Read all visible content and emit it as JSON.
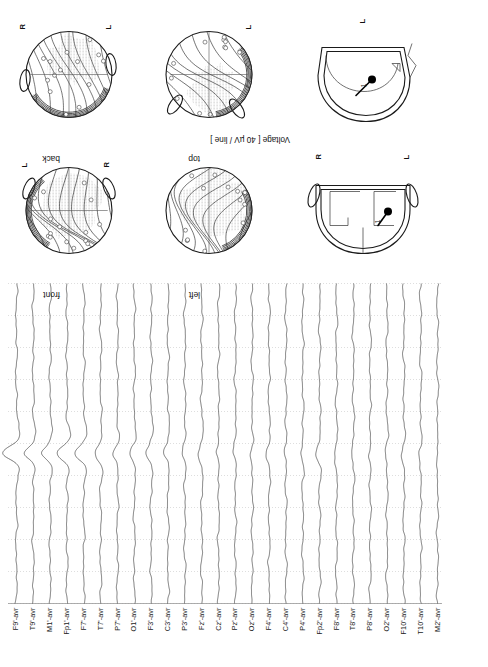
{
  "figure": {
    "voltage_caption": "Voltage [ 40 µV / line ]"
  },
  "eeg": {
    "channel_suffix": "-avr",
    "n_channels": 26,
    "channels": [
      "F9'-avr",
      "T9'-avr",
      "M1'-avr",
      "Fp1'-avr",
      "F7'-avr",
      "T7'-avr",
      "P7'-avr",
      "O1'-avr",
      "F3'-avr",
      "C3'-avr",
      "P3'-avr",
      "Fz'-avr",
      "Cz'-avr",
      "Pz'-avr",
      "Oz'-avr",
      "F4'-avr",
      "C4'-avr",
      "P4'-avr",
      "Fp2'-avr",
      "F8'-avr",
      "T8'-avr",
      "P8'-avr",
      "O2'-avr",
      "F10'-avr",
      "T10'-avr",
      "M2'-avr"
    ],
    "gridlines": 10,
    "trace_color": "#333333",
    "grid_color": "#c8c8c8"
  },
  "maps": {
    "views": [
      {
        "id": "front",
        "label": "front",
        "left_label": "L",
        "right_label": "R"
      },
      {
        "id": "back",
        "label": "back",
        "left_label": "L",
        "right_label": "R"
      },
      {
        "id": "left",
        "label": "left",
        "left_label": "",
        "right_label": ""
      },
      {
        "id": "top",
        "label": "top",
        "left_label": "L",
        "right_label": ""
      }
    ]
  },
  "dipole_views": [
    {
      "id": "coronal",
      "label_left": "L",
      "label_right": "R",
      "dipole_number": "1"
    },
    {
      "id": "sagittal",
      "label_left": "L",
      "label_right": "",
      "dipole_number": "1"
    }
  ],
  "chart_data": {
    "type": "line",
    "xlabel": "",
    "ylabel": "",
    "units": "µV",
    "scale_per_line": 40,
    "categories": [
      "F9'-avr",
      "T9'-avr",
      "M1'-avr",
      "Fp1'-avr",
      "F7'-avr",
      "T7'-avr",
      "P7'-avr",
      "O1'-avr",
      "F3'-avr",
      "C3'-avr",
      "P3'-avr",
      "Fz'-avr",
      "Cz'-avr",
      "Pz'-avr",
      "Oz'-avr",
      "F4'-avr",
      "C4'-avr",
      "P4'-avr",
      "Fp2'-avr",
      "F8'-avr",
      "T8'-avr",
      "P8'-avr",
      "O2'-avr",
      "F10'-avr",
      "T10'-avr",
      "M2'-avr"
    ],
    "gridlines": 10,
    "peak_position_fraction": 0.47,
    "series": [
      {
        "name": "F9'-avr",
        "peak_amplitude": 0.95
      },
      {
        "name": "T9'-avr",
        "peak_amplitude": 0.62
      },
      {
        "name": "M1'-avr",
        "peak_amplitude": 0.58
      },
      {
        "name": "Fp1'-avr",
        "peak_amplitude": 0.7
      },
      {
        "name": "F7'-avr",
        "peak_amplitude": 0.55
      },
      {
        "name": "T7'-avr",
        "peak_amplitude": 0.4
      },
      {
        "name": "P7'-avr",
        "peak_amplitude": 0.3
      },
      {
        "name": "O1'-avr",
        "peak_amplitude": 0.22
      },
      {
        "name": "F3'-avr",
        "peak_amplitude": 0.34
      },
      {
        "name": "C3'-avr",
        "peak_amplitude": 0.26
      },
      {
        "name": "P3'-avr",
        "peak_amplitude": 0.2
      },
      {
        "name": "Fz'-avr",
        "peak_amplitude": 0.24
      },
      {
        "name": "Cz'-avr",
        "peak_amplitude": 0.18
      },
      {
        "name": "Pz'-avr",
        "peak_amplitude": 0.16
      },
      {
        "name": "Oz'-avr",
        "peak_amplitude": 0.14
      },
      {
        "name": "F4'-avr",
        "peak_amplitude": 0.16
      },
      {
        "name": "C4'-avr",
        "peak_amplitude": 0.12
      },
      {
        "name": "P4'-avr",
        "peak_amplitude": 0.12
      },
      {
        "name": "Fp2'-avr",
        "peak_amplitude": 0.3
      },
      {
        "name": "F8'-avr",
        "peak_amplitude": 0.14
      },
      {
        "name": "T8'-avr",
        "peak_amplitude": 0.1
      },
      {
        "name": "P8'-avr",
        "peak_amplitude": 0.1
      },
      {
        "name": "O2'-avr",
        "peak_amplitude": 0.1
      },
      {
        "name": "F10'-avr",
        "peak_amplitude": 0.12
      },
      {
        "name": "T10'-avr",
        "peak_amplitude": 0.1
      },
      {
        "name": "M2'-avr",
        "peak_amplitude": 0.1
      }
    ]
  }
}
